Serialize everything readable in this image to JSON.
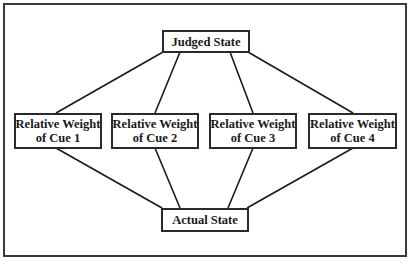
{
  "diagram": {
    "top_node": {
      "label": "Judged State"
    },
    "bottom_node": {
      "label": "Actual State"
    },
    "cues": [
      {
        "line1": "Relative Weight",
        "line2": "of Cue 1"
      },
      {
        "line1": "Relative Weight",
        "line2": "of Cue 2"
      },
      {
        "line1": "Relative Weight",
        "line2": "of Cue 3"
      },
      {
        "line1": "Relative Weight",
        "line2": "of Cue 4"
      }
    ],
    "edges": [
      {
        "from": "Judged State",
        "to": "Relative Weight of Cue 1"
      },
      {
        "from": "Judged State",
        "to": "Relative Weight of Cue 2"
      },
      {
        "from": "Judged State",
        "to": "Relative Weight of Cue 3"
      },
      {
        "from": "Judged State",
        "to": "Relative Weight of Cue 4"
      },
      {
        "from": "Relative Weight of Cue 1",
        "to": "Actual State"
      },
      {
        "from": "Relative Weight of Cue 2",
        "to": "Actual State"
      },
      {
        "from": "Relative Weight of Cue 3",
        "to": "Actual State"
      },
      {
        "from": "Relative Weight of Cue 4",
        "to": "Actual State"
      }
    ],
    "colors": {
      "line": "#1a1a1a",
      "border": "#2a2a2a",
      "background": "#ffffff"
    }
  }
}
